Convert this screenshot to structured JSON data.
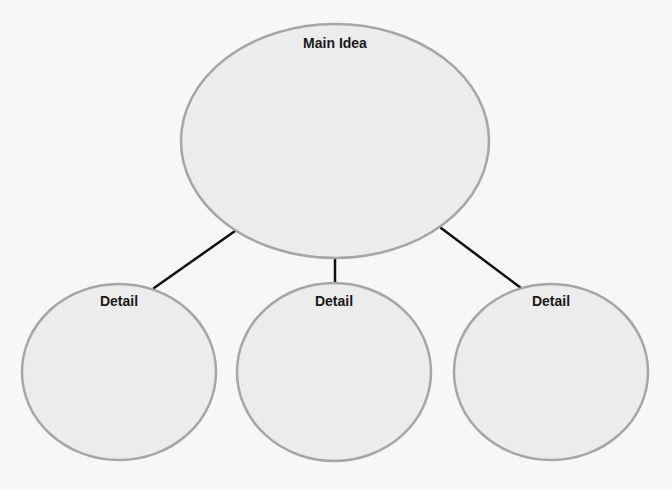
{
  "diagram": {
    "type": "concept-map",
    "colors": {
      "background": "#f7f7f7",
      "node_fill": "#ececec",
      "node_stroke": "#a6a6a6",
      "connector": "#111111",
      "text": "#1a1a1a"
    },
    "main_node": {
      "label": "Main Idea",
      "cx": 335,
      "cy": 141,
      "rx": 154,
      "ry": 117
    },
    "detail_nodes": [
      {
        "label": "Detail",
        "cx": 119,
        "cy": 372,
        "rx": 97,
        "ry": 88
      },
      {
        "label": "Detail",
        "cx": 334,
        "cy": 372,
        "rx": 97,
        "ry": 89
      },
      {
        "label": "Detail",
        "cx": 551,
        "cy": 372,
        "rx": 97,
        "ry": 88
      }
    ],
    "connectors": [
      {
        "x1": 235,
        "y1": 231,
        "x2": 154,
        "y2": 288
      },
      {
        "x1": 335,
        "y1": 258,
        "x2": 335,
        "y2": 283
      },
      {
        "x1": 441,
        "y1": 228,
        "x2": 521,
        "y2": 288
      }
    ]
  }
}
